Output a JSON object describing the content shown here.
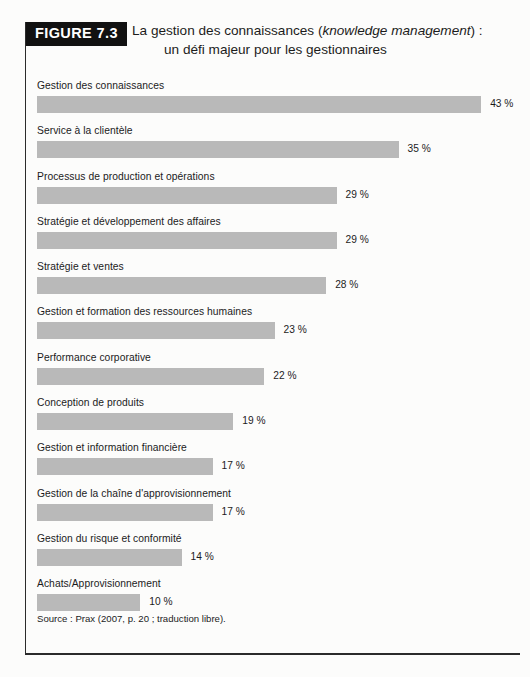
{
  "figure": {
    "badge": "FIGURE 7.3",
    "title_line1_pre": "La gestion des connaissances (",
    "title_line1_italic": "knowledge management",
    "title_line1_post": ") :",
    "title_line2": "un défi majeur pour les gestionnaires",
    "source": "Source : Prax (2007, p. 20 ; traduction libre)."
  },
  "colors": {
    "bar": "#b9b9b9",
    "badge_background": "#111111",
    "badge_text": "#ffffff",
    "text": "#1b1b1b",
    "rule": "#2b2b2b"
  },
  "chart_data": {
    "type": "bar",
    "orientation": "horizontal",
    "title": "La gestion des connaissances (knowledge management) : un défi majeur pour les gestionnaires",
    "xlabel": "",
    "ylabel": "",
    "xlim": [
      0,
      45
    ],
    "grid": false,
    "legend": false,
    "value_suffix": "%",
    "categories": [
      "Gestion des connaissances",
      "Service à la clientèle",
      "Processus de production et opérations",
      "Stratégie et développement des affaires",
      "Stratégie et ventes",
      "Gestion et formation des ressources humaines",
      "Performance corporative",
      "Conception de produits",
      "Gestion et information financière",
      "Gestion de la chaîne d'approvisionnement",
      "Gestion du risque et conformité",
      "Achats/Approvisionnement"
    ],
    "values": [
      43,
      35,
      29,
      29,
      28,
      23,
      22,
      19,
      17,
      17,
      14,
      10
    ],
    "value_labels": [
      "43 %",
      "35 %",
      "29 %",
      "29 %",
      "28 %",
      "23 %",
      "22 %",
      "19 %",
      "17 %",
      "17 %",
      "14 %",
      "10 %"
    ]
  }
}
